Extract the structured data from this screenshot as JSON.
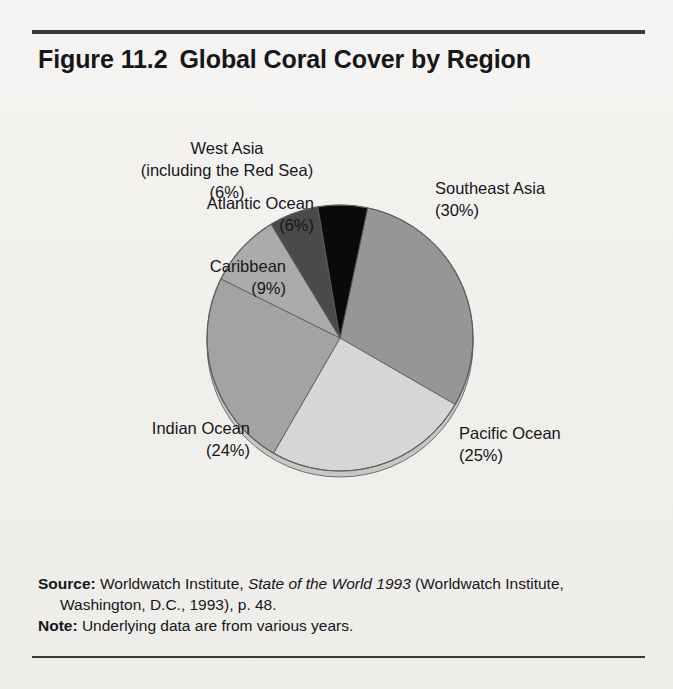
{
  "figure": {
    "number": "Figure 11.2",
    "title": "Global Coral Cover by Region"
  },
  "chart_data": {
    "type": "pie",
    "unit": "percent of global coral cover",
    "categories": [
      "Southeast Asia",
      "Pacific Ocean",
      "Indian Ocean",
      "Caribbean",
      "Atlantic Ocean",
      "West Asia (including the Red Sea)"
    ],
    "values": [
      30,
      25,
      24,
      9,
      6,
      6
    ],
    "total": 100,
    "legend": "none (direct slice labels)",
    "start_angle_deg": 12,
    "direction": "clockwise",
    "slices": [
      {
        "name": "Southeast Asia",
        "label": "Southeast Asia",
        "percent": 30,
        "percent_text": "(30%)",
        "color": "#969696",
        "start_deg": 12,
        "end_deg": 120
      },
      {
        "name": "Pacific Ocean",
        "label": "Pacific Ocean",
        "percent": 25,
        "percent_text": "(25%)",
        "color": "#d6d6d6",
        "start_deg": 120,
        "end_deg": 210
      },
      {
        "name": "Indian Ocean",
        "label": "Indian Ocean",
        "percent": 24,
        "percent_text": "(24%)",
        "color": "#a3a3a3",
        "start_deg": 210,
        "end_deg": 296.4
      },
      {
        "name": "Caribbean",
        "label": "Caribbean",
        "percent": 9,
        "percent_text": "(9%)",
        "color": "#ababab",
        "start_deg": 296.4,
        "end_deg": 328.8
      },
      {
        "name": "Atlantic Ocean",
        "label": "Atlantic Ocean",
        "percent": 6,
        "percent_text": "(6%)",
        "color": "#4a4a4a",
        "start_deg": 328.8,
        "end_deg": 350.4
      },
      {
        "name": "West Asia",
        "label": "West Asia",
        "label_line2": "(including the Red Sea)",
        "percent": 6,
        "percent_text": "(6%)",
        "color": "#0a0a0a",
        "start_deg": 350.4,
        "end_deg": 372
      }
    ]
  },
  "labels": {
    "west_asia": {
      "line1": "West Asia",
      "line2": "(including the Red Sea)",
      "pct": "(6%)"
    },
    "atlantic": {
      "line1": "Atlantic Ocean",
      "pct": "(6%)"
    },
    "caribbean": {
      "line1": "Caribbean",
      "pct": "(9%)"
    },
    "southeast": {
      "line1": "Southeast Asia",
      "pct": "(30%)"
    },
    "pacific": {
      "line1": "Pacific Ocean",
      "pct": "(25%)"
    },
    "indian": {
      "line1": "Indian Ocean",
      "pct": "(24%)"
    }
  },
  "footer": {
    "source_label": "Source:",
    "source_text_a": " Worldwatch Institute, ",
    "source_italic": "State of the World 1993",
    "source_text_b": " (Worldwatch Institute, Washington, D.C., 1993), p. 48.",
    "note_label": "Note:",
    "note_text": " Underlying data are from various years."
  },
  "colors": {
    "paper": "#f2f0ed",
    "ink": "#16161a",
    "rule": "#3a3a3c"
  }
}
